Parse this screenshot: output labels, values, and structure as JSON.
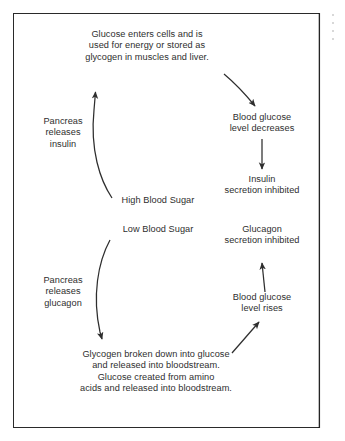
{
  "figure": {
    "kind": "blood-glucose-regulation-cycle-diagram",
    "background_color": "#ffffff",
    "border_color": "#2a2a2a",
    "text_color": "#2e2e2e"
  },
  "nodes": {
    "glucose_uptake": "Glucose enters cells and is\nused for energy or stored as\nglycogen in muscles and liver.",
    "pancreas_insulin": "Pancreas\nreleases\ninsulin",
    "blood_glucose_decreases": "Blood glucose\nlevel decreases",
    "insulin_inhibited": "Insulin\nsecretion inhibited",
    "high_blood_sugar": "High Blood Sugar",
    "low_blood_sugar": "Low Blood Sugar",
    "glucagon_inhibited": "Glucagon\nsecretion inhibited",
    "pancreas_glucagon": "Pancreas\nreleases\nglucagon",
    "blood_glucose_rises": "Blood glucose\nlevel rises",
    "glycogen_breakdown": "Glycogen broken down into glucose\nand released into bloodstream.\nGlucose created from amino\nacids and released into bloodstream."
  },
  "arrows": [
    {
      "name": "high-blood-sugar-to-glucose-uptake",
      "from": "high_blood_sugar",
      "to": "glucose_uptake",
      "style": "curved-up-left"
    },
    {
      "name": "glucose-uptake-to-blood-glucose-decreases",
      "from": "glucose_uptake",
      "to": "blood_glucose_decreases",
      "style": "curved-down-right"
    },
    {
      "name": "blood-glucose-decreases-to-insulin-inhibited",
      "from": "blood_glucose_decreases",
      "to": "insulin_inhibited",
      "style": "straight-down"
    },
    {
      "name": "low-blood-sugar-to-glycogen-breakdown",
      "from": "low_blood_sugar",
      "to": "glycogen_breakdown",
      "style": "curved-down-left"
    },
    {
      "name": "glycogen-breakdown-to-blood-glucose-rises",
      "from": "glycogen_breakdown",
      "to": "blood_glucose_rises",
      "style": "diagonal-up-right"
    },
    {
      "name": "blood-glucose-rises-to-glucagon-inhibited",
      "from": "blood_glucose_rises",
      "to": "glucagon_inhibited",
      "style": "straight-up"
    }
  ]
}
